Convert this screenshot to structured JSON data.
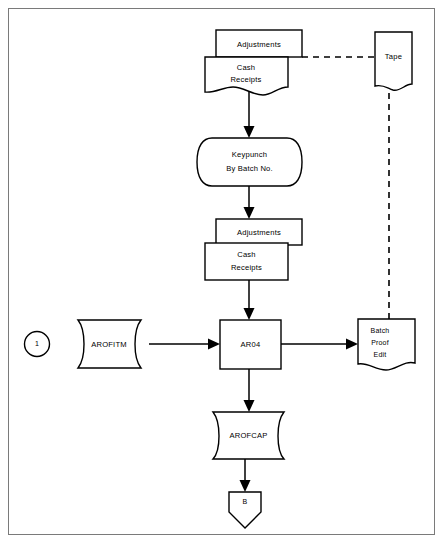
{
  "diagram": {
    "type": "flowchart",
    "title": "",
    "nodes": [
      {
        "id": "adjustments-top",
        "label": "Adjustments",
        "shape": "rectangle",
        "x": 255,
        "y": 45
      },
      {
        "id": "cash-receipts-top",
        "label_line1": "Cash",
        "label_line2": "Receipts",
        "shape": "document",
        "x": 245,
        "y": 75
      },
      {
        "id": "tape",
        "label": "Tape",
        "shape": "document",
        "x": 394,
        "y": 55
      },
      {
        "id": "keypunch",
        "label_line1": "Keypunch",
        "label_line2": "By Batch No.",
        "shape": "manual-operation",
        "x": 250,
        "y": 158
      },
      {
        "id": "adjustments-mid",
        "label": "Adjustments",
        "shape": "rectangle",
        "x": 256,
        "y": 231
      },
      {
        "id": "cash-receipts-mid",
        "label_line1": "Cash",
        "label_line2": "Receipts",
        "shape": "rectangle",
        "x": 245,
        "y": 261
      },
      {
        "id": "arofitm",
        "label": "AROFITM",
        "shape": "magnetic-file",
        "x": 113,
        "y": 344
      },
      {
        "id": "ar04",
        "label": "AR04",
        "shape": "process",
        "x": 249,
        "y": 344
      },
      {
        "id": "batch-proof-edit",
        "label_line1": "Batch",
        "label_line2": "Proof",
        "label_line3": "Edit",
        "shape": "document",
        "x": 385,
        "y": 344
      },
      {
        "id": "arofcap",
        "label": "AROFCAP",
        "shape": "magnetic-file",
        "x": 249,
        "y": 434
      },
      {
        "id": "connector-1",
        "label": "1",
        "shape": "circle-connector",
        "x": 37,
        "y": 344
      },
      {
        "id": "connector-b",
        "label": "B",
        "shape": "offpage-connector",
        "x": 245,
        "y": 503
      }
    ],
    "edges": [
      {
        "from": "cash-receipts-top",
        "to": "keypunch",
        "style": "solid",
        "arrow": true
      },
      {
        "from": "keypunch",
        "to": "adjustments-mid",
        "style": "solid",
        "arrow": true
      },
      {
        "from": "cash-receipts-mid",
        "to": "ar04",
        "style": "solid",
        "arrow": true
      },
      {
        "from": "arofitm",
        "to": "ar04",
        "style": "solid",
        "arrow": true
      },
      {
        "from": "ar04",
        "to": "batch-proof-edit",
        "style": "solid",
        "arrow": true
      },
      {
        "from": "ar04",
        "to": "arofcap",
        "style": "solid",
        "arrow": true
      },
      {
        "from": "arofcap",
        "to": "connector-b",
        "style": "solid",
        "arrow": true
      },
      {
        "from": "adjustments-top",
        "to": "tape",
        "style": "dashed",
        "arrow": false
      },
      {
        "from": "tape",
        "to": "batch-proof-edit",
        "style": "dashed",
        "arrow": false
      }
    ]
  },
  "colors": {
    "stroke": "#000000",
    "fill": "#ffffff",
    "frame": "#7a7a7a"
  }
}
